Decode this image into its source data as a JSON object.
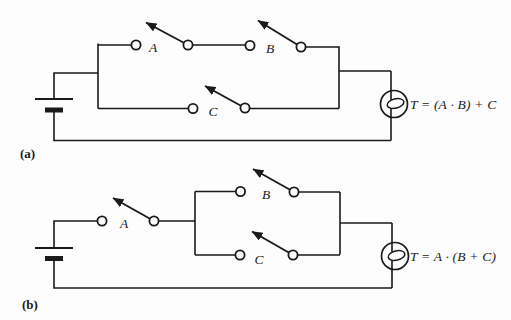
{
  "figure": {
    "background": "#fdfdfd",
    "ink": "#1a1a1a",
    "description_icons": {
      "battery": "battery-cell-icon",
      "lamp": "lamp-icon",
      "switch": "open-knife-switch-icon"
    },
    "circuits": [
      {
        "caption": "(a)",
        "equation": "T = (A · B) + C",
        "switch_labels": [
          "A",
          "B",
          "C"
        ]
      },
      {
        "caption": "(b)",
        "equation": "T = A · (B + C)",
        "switch_labels": [
          "A",
          "B",
          "C"
        ]
      }
    ]
  }
}
